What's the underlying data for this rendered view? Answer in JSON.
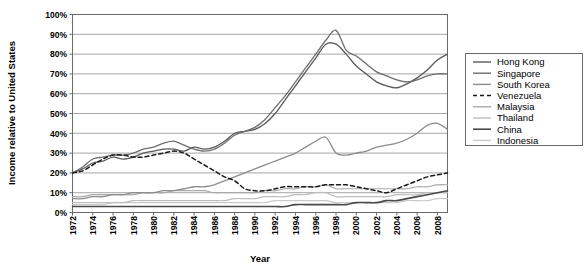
{
  "chart_data": {
    "type": "line",
    "title": "",
    "xlabel": "Year",
    "ylabel": "Income relative to United States",
    "xlim": [
      1972,
      2009
    ],
    "ylim": [
      0,
      100
    ],
    "grid": true,
    "legend_position": "right",
    "x_tick_labels": [
      "1972",
      "1974",
      "1976",
      "1978",
      "1980",
      "1982",
      "1984",
      "1986",
      "1988",
      "1990",
      "1992",
      "1994",
      "1996",
      "1998",
      "2000",
      "2002",
      "2004",
      "2006",
      "2008"
    ],
    "y_tick_labels": [
      "0%",
      "10%",
      "20%",
      "30%",
      "40%",
      "50%",
      "60%",
      "70%",
      "80%",
      "90%",
      "100%"
    ],
    "y_tick_values": [
      0,
      10,
      20,
      30,
      40,
      50,
      60,
      70,
      80,
      90,
      100
    ],
    "x": [
      1972,
      1973,
      1974,
      1975,
      1976,
      1977,
      1978,
      1979,
      1980,
      1981,
      1982,
      1983,
      1984,
      1985,
      1986,
      1987,
      1988,
      1989,
      1990,
      1991,
      1992,
      1993,
      1994,
      1995,
      1996,
      1997,
      1998,
      1999,
      2000,
      2001,
      2002,
      2003,
      2004,
      2005,
      2006,
      2007,
      2008,
      2009
    ],
    "series": [
      {
        "name": "Hong Kong",
        "color": "#5a5a5a",
        "width": 1.3,
        "dash": "none",
        "values": [
          20,
          22,
          25,
          26,
          28,
          27,
          28,
          30,
          31,
          32,
          32,
          31,
          33,
          32,
          33,
          36,
          40,
          41,
          42,
          45,
          50,
          57,
          64,
          71,
          78,
          85,
          85,
          80,
          74,
          70,
          66,
          64,
          63,
          65,
          68,
          72,
          77,
          80
        ]
      },
      {
        "name": "Singapore",
        "color": "#6e6e6e",
        "width": 1.3,
        "dash": "none",
        "values": [
          20,
          23,
          27,
          28,
          29,
          29,
          30,
          32,
          33,
          35,
          36,
          34,
          32,
          31,
          32,
          35,
          39,
          41,
          43,
          47,
          53,
          59,
          66,
          73,
          80,
          87,
          92,
          82,
          79,
          75,
          71,
          69,
          67,
          66,
          67,
          69,
          70,
          70
        ]
      },
      {
        "name": "South Korea",
        "color": "#8c8c8c",
        "width": 1.3,
        "dash": "none",
        "values": [
          7,
          7,
          8,
          8,
          9,
          9,
          10,
          10,
          10,
          11,
          11,
          12,
          13,
          13,
          14,
          16,
          18,
          20,
          22,
          24,
          26,
          28,
          30,
          33,
          36,
          38,
          30,
          29,
          30,
          31,
          33,
          34,
          35,
          37,
          40,
          44,
          45,
          42
        ]
      },
      {
        "name": "Venezuela",
        "color": "#1a1a1a",
        "width": 1.5,
        "dash": "4,3",
        "values": [
          20,
          21,
          24,
          27,
          29,
          29,
          28,
          28,
          29,
          30,
          31,
          30,
          27,
          24,
          21,
          18,
          16,
          12,
          11,
          11,
          12,
          13,
          13,
          13,
          13,
          14,
          14,
          14,
          13,
          12,
          11,
          10,
          12,
          14,
          16,
          18,
          19,
          20
        ]
      },
      {
        "name": "Malaysia",
        "color": "#a8a8a8",
        "width": 1.2,
        "dash": "none",
        "values": [
          8,
          8,
          9,
          9,
          9,
          9,
          9,
          10,
          10,
          10,
          11,
          11,
          11,
          11,
          10,
          10,
          10,
          10,
          10,
          11,
          11,
          12,
          12,
          13,
          13,
          14,
          12,
          12,
          12,
          12,
          12,
          12,
          12,
          12,
          13,
          13,
          14,
          14
        ]
      },
      {
        "name": "Thailand",
        "color": "#bdbdbd",
        "width": 1.2,
        "dash": "none",
        "values": [
          5,
          5,
          5,
          5,
          5,
          5,
          6,
          6,
          6,
          6,
          6,
          6,
          6,
          6,
          6,
          6,
          7,
          7,
          7,
          8,
          8,
          8,
          9,
          9,
          10,
          10,
          8,
          8,
          8,
          8,
          8,
          8,
          9,
          9,
          9,
          10,
          10,
          10
        ]
      },
      {
        "name": "China",
        "color": "#4a4a4a",
        "width": 1.6,
        "dash": "none",
        "values": [
          3,
          3,
          3,
          3,
          3,
          3,
          3,
          3,
          3,
          3,
          3,
          3,
          3,
          3,
          3,
          3,
          3,
          3,
          3,
          3,
          3,
          3,
          4,
          4,
          4,
          4,
          4,
          4,
          5,
          5,
          5,
          6,
          6,
          7,
          8,
          9,
          10,
          11
        ]
      },
      {
        "name": "Indonesia",
        "color": "#c9c9c9",
        "width": 1.2,
        "dash": "none",
        "values": [
          4,
          4,
          4,
          4,
          5,
          5,
          5,
          5,
          5,
          5,
          5,
          5,
          5,
          5,
          5,
          5,
          5,
          5,
          5,
          5,
          6,
          6,
          6,
          6,
          6,
          6,
          5,
          5,
          5,
          5,
          5,
          5,
          5,
          6,
          6,
          6,
          7,
          7
        ]
      }
    ]
  },
  "legend": {
    "items": [
      {
        "label": "Hong Kong"
      },
      {
        "label": "Singapore"
      },
      {
        "label": "South Korea"
      },
      {
        "label": "Venezuela"
      },
      {
        "label": "Malaysia"
      },
      {
        "label": "Thailand"
      },
      {
        "label": "China"
      },
      {
        "label": "Indonesia"
      }
    ]
  }
}
